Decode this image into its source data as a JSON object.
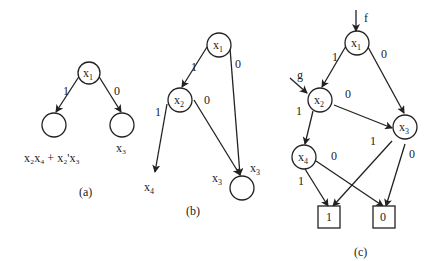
{
  "diagrams": [
    {
      "caption": "(a)",
      "root": {
        "var": "x",
        "sub": "1"
      },
      "edges": [
        {
          "label": "1"
        },
        {
          "label": "0"
        }
      ],
      "leaf_labels": [
        {
          "text": "x₂x₄ + x₂'x₃"
        },
        {
          "text": "x₃"
        }
      ]
    },
    {
      "caption": "(b)",
      "nodes": [
        {
          "var": "x",
          "sub": "1"
        },
        {
          "var": "x",
          "sub": "2"
        }
      ],
      "edges": [
        {
          "label": "1"
        },
        {
          "label": "0"
        },
        {
          "label": "1"
        },
        {
          "label": "0"
        }
      ],
      "labels": [
        {
          "var": "x",
          "sub": "4"
        },
        {
          "var": "x",
          "sub": "3"
        },
        {
          "var": "x",
          "sub": "3"
        }
      ]
    },
    {
      "caption": "(c)",
      "inputs": [
        {
          "label": "f"
        },
        {
          "label": "g"
        }
      ],
      "nodes": [
        {
          "var": "x",
          "sub": "1"
        },
        {
          "var": "x",
          "sub": "2"
        },
        {
          "var": "x",
          "sub": "3"
        },
        {
          "var": "x",
          "sub": "4"
        }
      ],
      "edges": [
        {
          "label": "1"
        },
        {
          "label": "0"
        },
        {
          "label": "1"
        },
        {
          "label": "0"
        },
        {
          "label": "1"
        },
        {
          "label": "0"
        },
        {
          "label": "1"
        },
        {
          "label": "0"
        }
      ],
      "terminals": [
        {
          "label": "1"
        },
        {
          "label": "0"
        }
      ]
    }
  ]
}
